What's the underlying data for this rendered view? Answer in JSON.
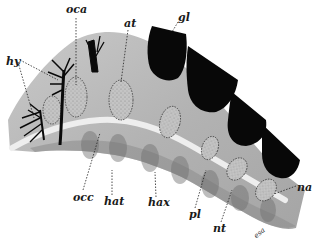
{
  "figure": {
    "type": "anatomical-diagram",
    "background": "#ffffff",
    "tissue_color": "#b9b9b9",
    "dark_fill_color": "#0a0a0a",
    "labels": [
      {
        "id": "oca",
        "text": "oca"
      },
      {
        "id": "at",
        "text": "at"
      },
      {
        "id": "gl",
        "text": "gl"
      },
      {
        "id": "hy",
        "text": "hy"
      },
      {
        "id": "occ",
        "text": "occ"
      },
      {
        "id": "hat",
        "text": "hat"
      },
      {
        "id": "hax",
        "text": "hax"
      },
      {
        "id": "pl",
        "text": "pl"
      },
      {
        "id": "nt",
        "text": "nt"
      },
      {
        "id": "na",
        "text": "na"
      },
      {
        "id": "esa",
        "text": "esa"
      }
    ]
  }
}
